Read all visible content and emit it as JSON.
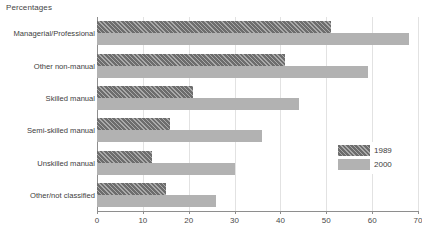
{
  "chart_data": {
    "type": "bar",
    "orientation": "horizontal",
    "title": "Percentages",
    "xlabel": "",
    "ylabel": "",
    "xlim": [
      0,
      70
    ],
    "xticks": [
      0,
      10,
      20,
      30,
      40,
      50,
      60,
      70
    ],
    "grid": true,
    "legend_position": "lower-right",
    "categories": [
      "Managerial/Professional",
      "Other non-manual",
      "Skilled manual",
      "Semi-skilled manual",
      "Unskilled manual",
      "Other/not classified"
    ],
    "series": [
      {
        "name": "1989",
        "color": "#6d6d6d",
        "pattern": "diagonal-hatch",
        "values": [
          51,
          41,
          21,
          16,
          12,
          15
        ]
      },
      {
        "name": "2000",
        "color": "#b2b2b2",
        "pattern": "solid",
        "values": [
          68,
          59,
          44,
          36,
          30,
          26
        ]
      }
    ]
  },
  "footnote": ""
}
